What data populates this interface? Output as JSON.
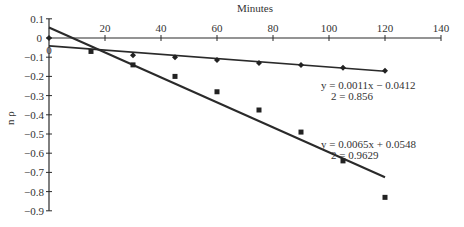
{
  "chart_data": {
    "type": "scatter",
    "title": "",
    "xlabel": "Minutes",
    "ylabel": "n ρ",
    "xlim": [
      0,
      140
    ],
    "ylim": [
      -0.9,
      0.1
    ],
    "x_ticks": [
      20,
      40,
      60,
      80,
      100,
      120,
      140
    ],
    "x_tick_labels": [
      "20",
      "40",
      "60",
      "80",
      "100",
      "120",
      "140"
    ],
    "y_ticks": [
      0.1,
      0,
      -0.1,
      -0.2,
      -0.3,
      -0.4,
      -0.5,
      -0.6,
      -0.7,
      -0.8,
      -0.9
    ],
    "y_tick_labels": [
      "0.1",
      "0",
      "−0.1",
      "−0.2",
      "−0.3",
      "−0.4",
      "−0.5",
      "−0.6",
      "−0.7",
      "−0.8",
      "−0.9"
    ],
    "x_axis_position": "y=0 (top)",
    "grid": false,
    "legend": "none",
    "series": [
      {
        "name": "series-1 (diamond)",
        "marker": "diamond",
        "x": [
          0,
          30,
          45,
          60,
          75,
          90,
          105,
          120
        ],
        "y": [
          0,
          -0.09,
          -0.1,
          -0.115,
          -0.13,
          -0.14,
          -0.155,
          -0.17
        ],
        "trendline": {
          "slope": -0.0011,
          "intercept": -0.0412
        },
        "equation": "y = 0.0011x − 0.0412",
        "r2": "2 = 0.856"
      },
      {
        "name": "series-2 (square)",
        "marker": "square",
        "x": [
          15,
          30,
          45,
          60,
          75,
          90,
          105,
          120
        ],
        "y": [
          -0.07,
          -0.14,
          -0.2,
          -0.28,
          -0.375,
          -0.49,
          -0.64,
          -0.83
        ],
        "trendline": {
          "slope": -0.0065,
          "intercept": 0.0548
        },
        "equation": "y = 0.0065x + 0.0548",
        "r2": "2 = 0.9629"
      }
    ],
    "annotations": [
      {
        "text": "y = 0.0011x − 0.0412",
        "anchor_x_min": 97,
        "anchor_y": -0.21
      },
      {
        "text": "2 = 0.856",
        "anchor_x_min": 97,
        "anchor_y": -0.25
      },
      {
        "text": "y = 0.0065x + 0.0548",
        "anchor_x_min": 97,
        "anchor_y": -0.55
      },
      {
        "text": "2 = 0.9629",
        "anchor_x_min": 97,
        "anchor_y": -0.59
      }
    ],
    "origin_labels": [
      "0",
      "0"
    ]
  },
  "colors": {
    "line": "#2a2a2a",
    "marker": "#222222",
    "text": "#333333",
    "background": "#ffffff"
  }
}
